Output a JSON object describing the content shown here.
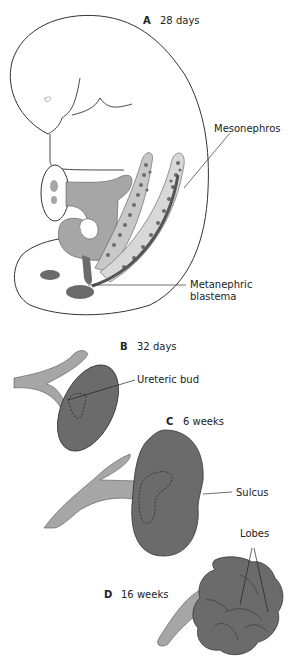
{
  "figure": {
    "colors": {
      "outline": "#333333",
      "light_gray": "#a6a6a6",
      "dark_gray": "#6b6b6b",
      "kidney": "#707070",
      "background": "#ffffff"
    },
    "panels": [
      {
        "letter": "A",
        "age": "28 days",
        "labels": [
          "Mesonephros",
          "Metanephric",
          "blastema"
        ]
      },
      {
        "letter": "B",
        "age": "32 days",
        "labels": [
          "Ureteric bud"
        ]
      },
      {
        "letter": "C",
        "age": "6 weeks",
        "labels": [
          "Sulcus"
        ]
      },
      {
        "letter": "D",
        "age": "16 weeks",
        "labels": [
          "Lobes"
        ]
      }
    ]
  }
}
